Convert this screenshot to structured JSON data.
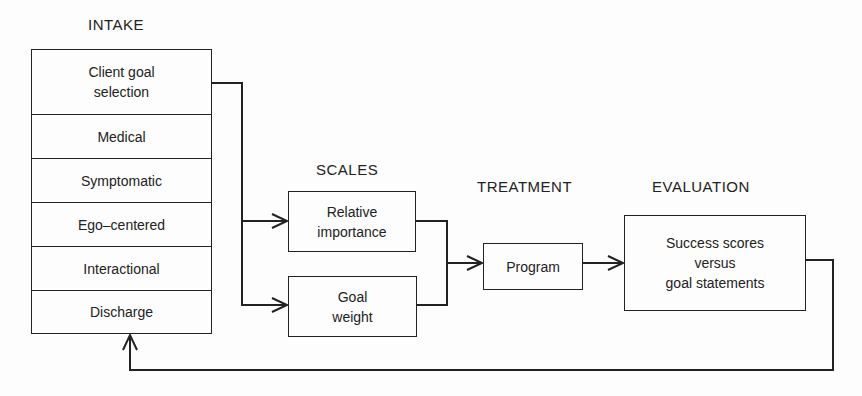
{
  "diagram": {
    "stages": {
      "intake": {
        "title": "INTAKE",
        "items": [
          {
            "label": "Client goal\nselection"
          },
          {
            "label": "Medical"
          },
          {
            "label": "Symptomatic"
          },
          {
            "label": "Ego–centered"
          },
          {
            "label": "Interactional"
          },
          {
            "label": "Discharge"
          }
        ]
      },
      "scales": {
        "title": "SCALES",
        "items": [
          {
            "label": "Relative\nimportance"
          },
          {
            "label": "Goal\nweight"
          }
        ]
      },
      "treatment": {
        "title": "TREATMENT",
        "items": [
          {
            "label": "Program"
          }
        ]
      },
      "evaluation": {
        "title": "EVALUATION",
        "items": [
          {
            "label": "Success scores\nversus\ngoal statements"
          }
        ]
      }
    },
    "connections": [
      {
        "from": "Client goal selection",
        "to": "Relative importance"
      },
      {
        "from": "Client goal selection",
        "to": "Goal weight"
      },
      {
        "from": "Relative importance",
        "to": "Program"
      },
      {
        "from": "Goal weight",
        "to": "Program"
      },
      {
        "from": "Program",
        "to": "Success scores versus goal statements"
      },
      {
        "from": "Success scores versus goal statements",
        "to": "Discharge"
      }
    ],
    "colors": {
      "line": "#222222",
      "background": "#fdfdfd"
    }
  }
}
